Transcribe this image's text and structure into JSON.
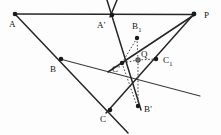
{
  "figure": {
    "type": "geometry-diagram",
    "width": 221,
    "height": 135,
    "background_color": "#fdfdfd",
    "line_color": "#262626",
    "dashed_color": "#4a4a4a",
    "point_color": "#1a1a1a",
    "labels": {
      "A": "A",
      "A_prime": "A'",
      "B": "B",
      "B_prime": "B'",
      "B_one": "B",
      "B_one_sub": "1",
      "C": "C",
      "C_prime": "C'",
      "C_one": "C",
      "C_one_sub": "1",
      "P": "P",
      "Q": "Q"
    },
    "points": [
      {
        "name": "A",
        "x": 15,
        "y": 14
      },
      {
        "name": "A'",
        "x": 112,
        "y": 15
      },
      {
        "name": "P",
        "x": 194,
        "y": 14
      },
      {
        "name": "B1",
        "x": 137,
        "y": 38
      },
      {
        "name": "B",
        "x": 61,
        "y": 59
      },
      {
        "name": "Q",
        "x": 138,
        "y": 60
      },
      {
        "name": "C'",
        "x": 122,
        "y": 63
      },
      {
        "name": "C1",
        "x": 156,
        "y": 59
      },
      {
        "name": "B'",
        "x": 138,
        "y": 106
      },
      {
        "name": "C",
        "x": 110,
        "y": 110
      }
    ]
  }
}
